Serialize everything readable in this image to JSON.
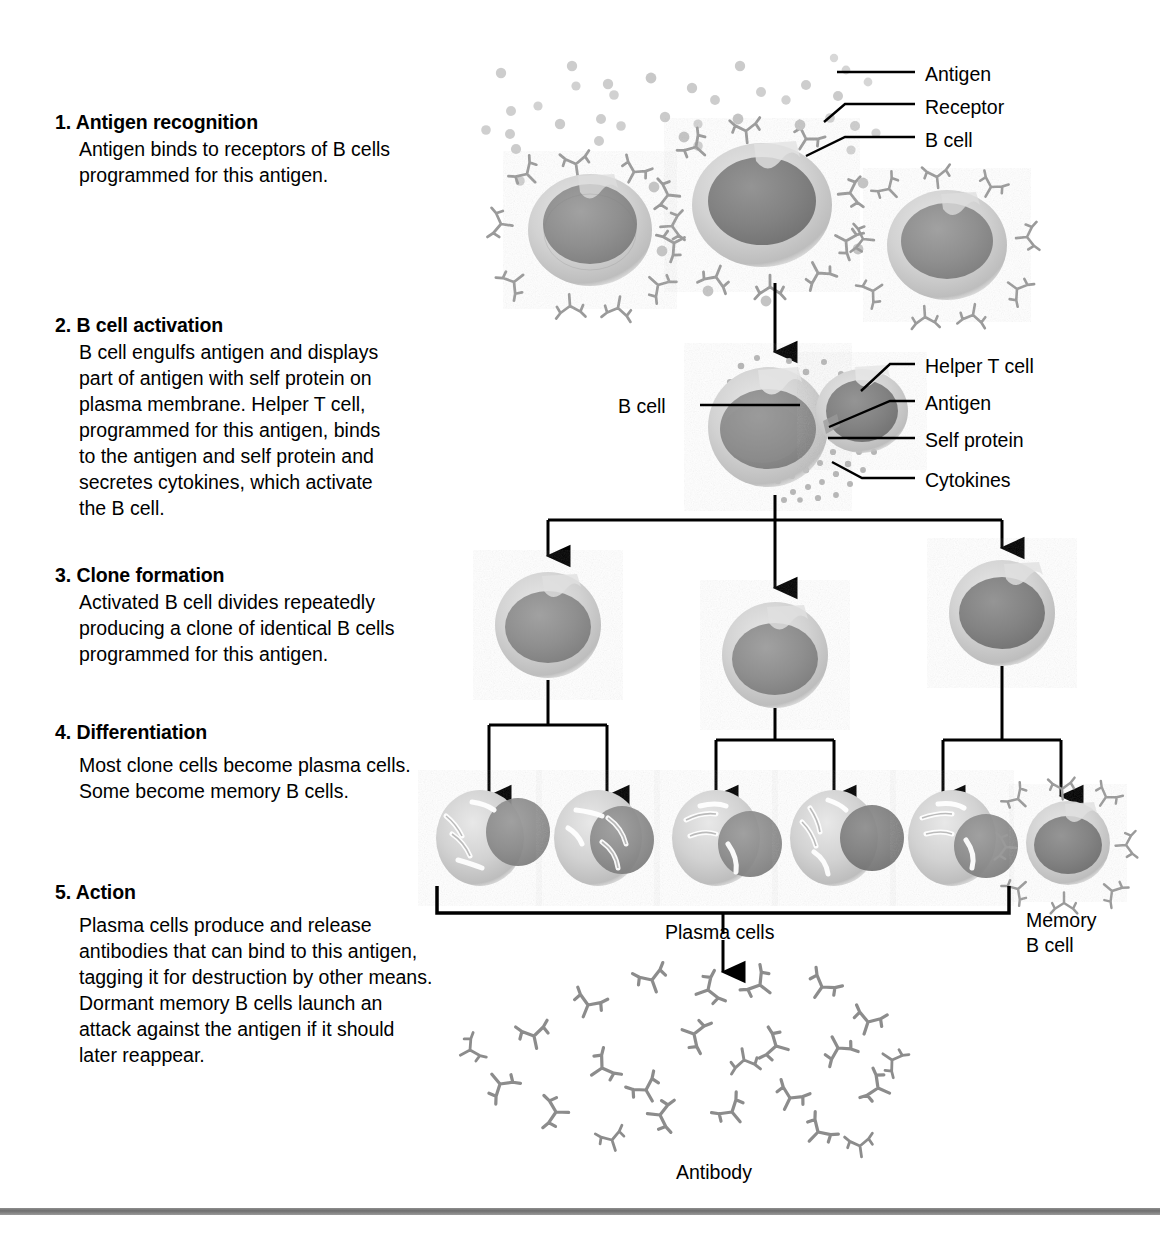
{
  "steps": [
    {
      "number": "1.",
      "title": "Antigen recognition",
      "body": "Antigen binds to receptors of  B cells\nprogrammed for this antigen.",
      "top": 110
    },
    {
      "number": "2.",
      "title": "B cell activation",
      "body": "B cell engulfs antigen and displays\npart of antigen with self protein on\nplasma membrane. Helper T cell,\nprogrammed for this antigen, binds\nto the antigen and self protein and\nsecretes cytokines, which activate\nthe B cell.",
      "top": 313
    },
    {
      "number": "3.",
      "title": "Clone formation",
      "body": "Activated B cell divides repeatedly\nproducing a clone of identical B cells\nprogrammed for this antigen.",
      "top": 563
    },
    {
      "number": "4.",
      "title": "Differentiation",
      "body": "Most clone cells become plasma cells.\nSome become memory B cells.",
      "top": 720
    },
    {
      "number": "5.",
      "title": "Action",
      "body": "Plasma cells produce and release\nantibodies that can bind to this antigen,\ntagging it for destruction by other means.\nDormant memory B cells launch an\nattack against the antigen if it should\nlater reappear.",
      "top": 880
    }
  ],
  "callouts": [
    {
      "id": "antigen-top",
      "text": "Antigen",
      "x": 925,
      "y": 63
    },
    {
      "id": "receptor",
      "text": "Receptor",
      "x": 925,
      "y": 96
    },
    {
      "id": "b-cell-top",
      "text": "B cell",
      "x": 925,
      "y": 129
    },
    {
      "id": "helper-t-cell",
      "text": "Helper T cell",
      "x": 925,
      "y": 355
    },
    {
      "id": "antigen-mid",
      "text": "Antigen",
      "x": 925,
      "y": 392
    },
    {
      "id": "self-protein",
      "text": "Self protein",
      "x": 925,
      "y": 429
    },
    {
      "id": "cytokines",
      "text": "Cytokines",
      "x": 925,
      "y": 469
    },
    {
      "id": "b-cell-left",
      "text": "B cell",
      "x": 618,
      "y": 395
    },
    {
      "id": "plasma-cells",
      "text": "Plasma cells",
      "x": 665,
      "y": 895
    },
    {
      "id": "memory-b-cell",
      "text": "Memory\nB cell",
      "x": 1026,
      "y": 883
    },
    {
      "id": "antibody",
      "text": "Antibody",
      "x": 676,
      "y": 1163
    }
  ],
  "palette": {
    "ink": "#000000",
    "cell_cytoplasm": "#c6c6c6",
    "cell_nucleus": "#8a8a8a",
    "receptor": "#9a9a9a",
    "antigen_dot": "#c9c9c9",
    "cytokine_dot": "#b4b4b4",
    "antibody": "#9a9a9a",
    "er_highlight": "#ffffff",
    "rule": "#7a7a7a",
    "background": "#ffffff"
  },
  "diagram_elements": {
    "row1_b_cells": 3,
    "row3_clone_cells": 3,
    "row4_plasma_cells": 5,
    "row4_memory_b_cells": 1,
    "antibody_count": 24,
    "free_antigen_dots": 30
  },
  "bottom_rule": {
    "top": 1208
  }
}
